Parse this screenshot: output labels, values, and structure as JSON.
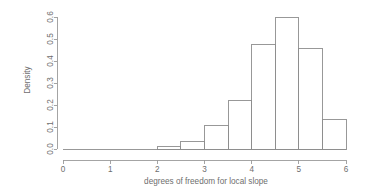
{
  "chart_data": {
    "type": "bar",
    "title": "",
    "subtitle": "",
    "xlabel": "degrees of freedom for local slope",
    "ylabel": "Density",
    "xlim": [
      0,
      6
    ],
    "ylim": [
      0,
      0.6
    ],
    "grid": false,
    "legend": null,
    "bin_width": 0.5,
    "bin_edges": [
      0,
      0.5,
      1,
      1.5,
      2,
      2.5,
      3,
      3.5,
      4,
      4.5,
      5,
      5.5,
      6
    ],
    "categories": [
      "0-0.5",
      "0.5-1",
      "1-1.5",
      "1.5-2",
      "2-2.5",
      "2.5-3",
      "3-3.5",
      "3.5-4",
      "4-4.5",
      "4.5-5",
      "5-5.5",
      "5.5-6"
    ],
    "values": [
      0,
      0,
      0,
      0,
      0.013,
      0.036,
      0.105,
      0.22,
      0.475,
      0.6,
      0.455,
      0.136
    ],
    "x_ticks": [
      0,
      1,
      2,
      3,
      4,
      5,
      6
    ],
    "x_tick_labels": [
      "0",
      "1",
      "2",
      "3",
      "4",
      "5",
      "6"
    ],
    "y_ticks": [
      0,
      0.1,
      0.2,
      0.3,
      0.4,
      0.5,
      0.6
    ],
    "y_tick_labels": [
      "0.0",
      "0.1",
      "0.2",
      "0.3",
      "0.4",
      "0.5",
      "0.6"
    ],
    "colors": {
      "bar_stroke": "#8d8d8d",
      "bar_fill": "none",
      "axis": "#9a9a9a",
      "text": "#6e6e6e",
      "background": "#ffffff"
    }
  }
}
